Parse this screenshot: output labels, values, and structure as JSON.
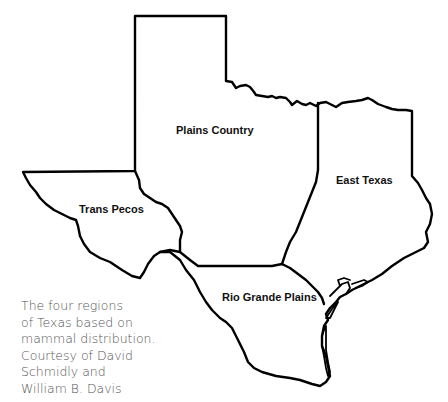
{
  "map": {
    "title": "Texas mammal distribution regions",
    "outline_color": "#000000",
    "background": "#ffffff",
    "regions": [
      {
        "id": "plains-country",
        "label": "Plains Country",
        "label_x": 176,
        "label_y": 124
      },
      {
        "id": "east-texas",
        "label": "East Texas",
        "label_x": 336,
        "label_y": 174
      },
      {
        "id": "trans-pecos",
        "label": "Trans Pecos",
        "label_x": 79,
        "label_y": 203
      },
      {
        "id": "rio-grande-plains",
        "label": "Rio Grande Plains",
        "label_x": 222,
        "label_y": 291
      }
    ]
  },
  "caption": {
    "lines": [
      "The four regions",
      "of Texas based on",
      "mammal distribution.",
      "Courtesy of David",
      "Schmidly and",
      "William B. Davis"
    ],
    "color": "#555555"
  }
}
